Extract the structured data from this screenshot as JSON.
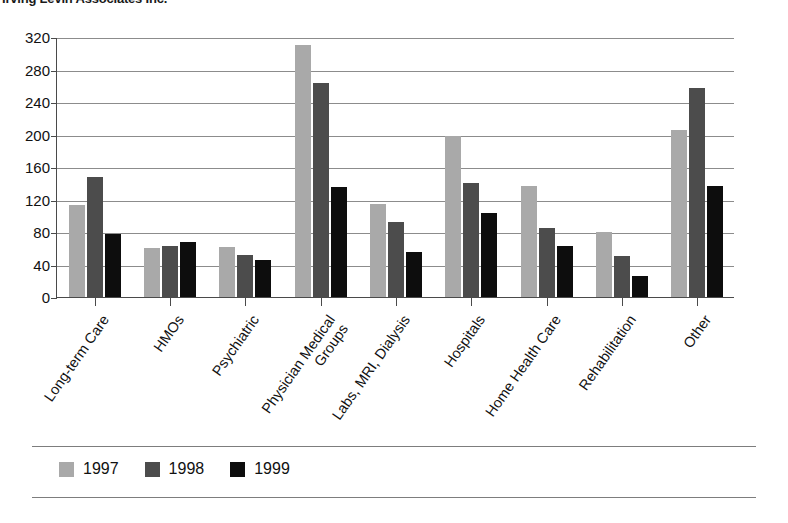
{
  "source_note": "Irving Levin Associates Inc.",
  "legend": {
    "position": "bottom-left",
    "entries": [
      {
        "label": "1997",
        "color": "#a9a9a9",
        "swatch": "legend-swatch-1997"
      },
      {
        "label": "1998",
        "color": "#4c4c4c",
        "swatch": "legend-swatch-1998"
      },
      {
        "label": "1999",
        "color": "#0d0d0d",
        "swatch": "legend-swatch-1999"
      }
    ]
  },
  "axis": {
    "y_ticks": [
      "0",
      "40",
      "80",
      "120",
      "160",
      "200",
      "240",
      "280",
      "320"
    ]
  },
  "chart_data": {
    "type": "bar",
    "title": "",
    "subtitle": "",
    "xlabel": "",
    "ylabel": "",
    "ylim": [
      0,
      320
    ],
    "ytick_step": 40,
    "grid": true,
    "legend_position": "bottom-left",
    "categories": [
      "Long-term Care",
      "HMOs",
      "Psychiatric",
      "Physician Medical Groups",
      "Labs, MRI, Dialysis",
      "Hospitals",
      "Home Health Care",
      "Rehabilitation",
      "Other"
    ],
    "category_lines": [
      [
        "Long-term Care"
      ],
      [
        "HMOs"
      ],
      [
        "Psychiatric"
      ],
      [
        "Physician Medical",
        "Groups"
      ],
      [
        "Labs, MRI, Dialysis"
      ],
      [
        "Hospitals"
      ],
      [
        "Home Health Care"
      ],
      [
        "Rehabilitation"
      ],
      [
        "Other"
      ]
    ],
    "series": [
      {
        "name": "1997",
        "color": "#a9a9a9",
        "values": [
          113,
          60,
          62,
          310,
          115,
          198,
          137,
          80,
          206
        ]
      },
      {
        "name": "1998",
        "color": "#4c4c4c",
        "values": [
          148,
          63,
          52,
          263,
          92,
          140,
          85,
          50,
          257
        ]
      },
      {
        "name": "1999",
        "color": "#0d0d0d",
        "values": [
          78,
          68,
          45,
          135,
          55,
          103,
          63,
          26,
          137
        ]
      }
    ]
  }
}
